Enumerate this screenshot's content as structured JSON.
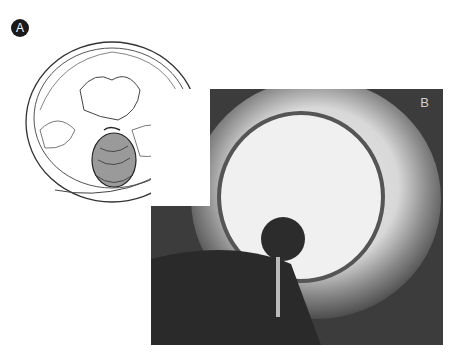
{
  "figure": {
    "panels": [
      {
        "label": "A",
        "type": "illustration",
        "signature": "E Taquin"
      },
      {
        "label": "B",
        "type": "photograph"
      }
    ],
    "colors": {
      "badge_a_bg": "#1a1a1a",
      "badge_a_fg": "#ffffff",
      "photo_bg": "#444444"
    }
  }
}
